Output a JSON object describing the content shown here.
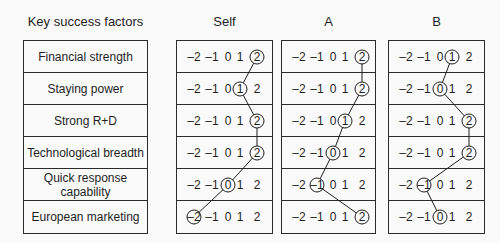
{
  "header": {
    "factors": "Key success factors"
  },
  "factors": [
    "Financial strength",
    "Staying power",
    "Strong R+D",
    "Technological breadth",
    "Quick response capability",
    "European marketing"
  ],
  "scale_labels": [
    "–2",
    "–1",
    "0",
    "1",
    "2"
  ],
  "scale_values": [
    -2,
    -1,
    0,
    1,
    2
  ],
  "columns": [
    {
      "label": "Self",
      "ratings": [
        2,
        1,
        2,
        2,
        0,
        -2
      ]
    },
    {
      "label": "A",
      "ratings": [
        2,
        2,
        1,
        0,
        -1,
        2
      ]
    },
    {
      "label": "B",
      "ratings": [
        1,
        0,
        2,
        2,
        -1,
        0
      ]
    }
  ],
  "colors": {
    "ink": "#1f1f1f",
    "line": "#2b2b2b",
    "background": "#fafafa"
  }
}
